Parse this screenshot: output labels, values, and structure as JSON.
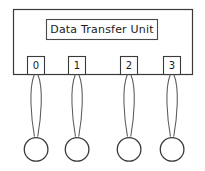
{
  "diagram": {
    "kind": "block-diagram",
    "background_color": "#ffffff",
    "line_color": "#3a3a3a",
    "text_color": "#1a1a1a",
    "unit": {
      "title": "Data Transfer Unit",
      "title_box_label": "unit-title-box",
      "body_label": "unit-body"
    },
    "ports": [
      {
        "label": "0",
        "terminal_label": "connector"
      },
      {
        "label": "1",
        "terminal_label": "connector"
      },
      {
        "label": "2",
        "terminal_label": "connector"
      },
      {
        "label": "3",
        "terminal_label": "connector"
      }
    ]
  }
}
